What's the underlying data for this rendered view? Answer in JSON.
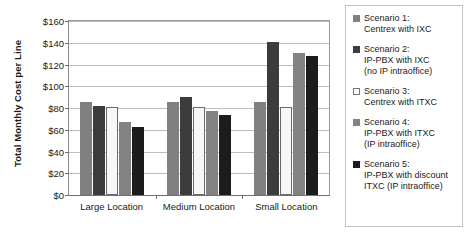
{
  "chart_data": {
    "type": "bar",
    "title": "",
    "xlabel": "",
    "ylabel": "Total Monthly Cost per Line",
    "categories": [
      "Large Location",
      "Medium Location",
      "Small Location"
    ],
    "ylim": [
      0,
      160
    ],
    "ytick_values": [
      0,
      20,
      40,
      60,
      80,
      100,
      120,
      140,
      160
    ],
    "ytick_labels": [
      "$0",
      "$20",
      "$40",
      "$60",
      "$80",
      "$100",
      "$120",
      "$140",
      "$160"
    ],
    "grid": true,
    "legend_position": "right",
    "series": [
      {
        "name": "Scenario 1: Centrex with IXC",
        "color": "#808080",
        "outlined": false,
        "values": [
          85,
          85,
          85
        ]
      },
      {
        "name": "Scenario 2: IP-PBX with IXC (no IP intraoffice)",
        "color": "#3c3c3c",
        "outlined": false,
        "values": [
          81,
          89,
          139
        ]
      },
      {
        "name": "Scenario 3: Centrex with ITXC",
        "color": "#f7f7f7",
        "outlined": true,
        "values": [
          80,
          80,
          80
        ]
      },
      {
        "name": "Scenario 4: IP-PBX with ITXC (IP intraoffice)",
        "color": "#838383",
        "outlined": false,
        "values": [
          66,
          76,
          129
        ]
      },
      {
        "name": "Scenario 5: IP-PBX with discount ITXC (IP intraoffice)",
        "color": "#1c1c1c",
        "outlined": false,
        "values": [
          62,
          73,
          126
        ]
      }
    ]
  },
  "legend": {
    "items": [
      {
        "swatch_color": "#808080",
        "outlined": false,
        "lines": [
          "Scenario 1:",
          "Centrex with IXC"
        ]
      },
      {
        "swatch_color": "#3c3c3c",
        "outlined": false,
        "lines": [
          "Scenario 2:",
          "IP-PBX with IXC",
          "(no IP intraoffice)"
        ]
      },
      {
        "swatch_color": "#ffffff",
        "outlined": true,
        "lines": [
          "Scenario 3:",
          "Centrex with ITXC"
        ]
      },
      {
        "swatch_color": "#838383",
        "outlined": false,
        "lines": [
          "Scenario 4:",
          "IP-PBX with ITXC",
          "(IP intraoffice)"
        ]
      },
      {
        "swatch_color": "#1c1c1c",
        "outlined": false,
        "lines": [
          "Scenario 5:",
          "IP-PBX with discount",
          "ITXC (IP intraoffice)"
        ]
      }
    ]
  }
}
